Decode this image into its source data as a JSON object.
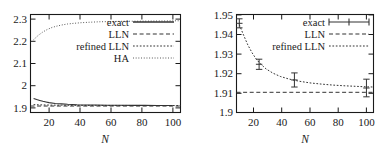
{
  "figure": {
    "panel_count": 2,
    "background_color": "#ffffff",
    "line_color": "#333333"
  },
  "chart_data": [
    {
      "id": "left",
      "type": "line",
      "title": "",
      "xlabel": "N",
      "ylabel": "",
      "xlim": [
        8,
        105
      ],
      "ylim": [
        1.88,
        2.335
      ],
      "xticks": [
        20,
        40,
        60,
        80,
        100
      ],
      "xticklabels": [
        "20",
        "40",
        "60",
        "80",
        "100"
      ],
      "yticks": [
        1.9,
        2.0,
        2.1,
        2.2,
        2.3
      ],
      "yticklabels": [
        "1.9",
        "2",
        "2.1",
        "2.2",
        "2.3"
      ],
      "grid": false,
      "legend_position": "upper right inside",
      "series": [
        {
          "name": "exact",
          "style": "solid",
          "x": [
            10,
            12,
            14,
            16,
            18,
            20,
            24,
            28,
            32,
            38,
            44,
            50,
            58,
            66,
            74,
            82,
            90,
            100
          ],
          "y": [
            1.945,
            1.94,
            1.936,
            1.932,
            1.929,
            1.926,
            1.922,
            1.92,
            1.918,
            1.916,
            1.915,
            1.9145,
            1.914,
            1.9135,
            1.913,
            1.913,
            1.9128,
            1.9125
          ]
        },
        {
          "name": "LLN",
          "style": "dashed",
          "x": [
            8,
            105
          ],
          "y": [
            1.91,
            1.91
          ]
        },
        {
          "name": "refined LLN",
          "style": "dotted",
          "x": [
            10,
            14,
            18,
            22,
            28,
            34,
            42,
            50,
            60,
            70,
            80,
            90,
            100,
            105
          ],
          "y": [
            1.9165,
            1.9155,
            1.9148,
            1.9143,
            1.9138,
            1.9134,
            1.9131,
            1.9129,
            1.9127,
            1.9126,
            1.9125,
            1.9124,
            1.9123,
            1.9123
          ]
        },
        {
          "name": "HA",
          "style": "fine-dotted",
          "x": [
            10,
            13,
            16,
            19,
            22,
            25,
            28,
            32,
            36,
            41,
            46,
            52,
            58,
            64,
            70,
            78,
            86,
            94,
            100,
            105
          ],
          "y": [
            2.218,
            2.238,
            2.254,
            2.266,
            2.275,
            2.281,
            2.286,
            2.291,
            2.294,
            2.297,
            2.299,
            2.301,
            2.302,
            2.303,
            2.3035,
            2.304,
            2.3045,
            2.305,
            2.3055,
            2.306
          ]
        }
      ],
      "legend": [
        {
          "label": "exact",
          "style": "solid"
        },
        {
          "label": "LLN",
          "style": "dashed"
        },
        {
          "label": "refined LLN",
          "style": "dotted"
        },
        {
          "label": "HA",
          "style": "fine-dotted"
        }
      ]
    },
    {
      "id": "right",
      "type": "line",
      "title": "",
      "xlabel": "N",
      "ylabel": "",
      "xlim": [
        8,
        105
      ],
      "ylim": [
        1.9,
        1.95
      ],
      "xticks": [
        20,
        40,
        60,
        80,
        100
      ],
      "xticklabels": [
        "20",
        "40",
        "60",
        "80",
        "100"
      ],
      "yticks": [
        1.9,
        1.91,
        1.92,
        1.93,
        1.94,
        1.95
      ],
      "yticklabels": [
        "1.9",
        "1.91",
        "1.92",
        "1.93",
        "1.94",
        "1.95"
      ],
      "grid": false,
      "legend_position": "upper right inside",
      "series": [
        {
          "name": "exact",
          "style": "errorbar",
          "x": [
            10,
            24,
            49,
            100
          ],
          "y": [
            1.9455,
            1.9246,
            1.9166,
            1.9125
          ],
          "yerr": [
            0.0023,
            0.0026,
            0.0036,
            0.0045
          ]
        },
        {
          "name": "LLN",
          "style": "dashed",
          "x": [
            8,
            105
          ],
          "y": [
            1.9103,
            1.9103
          ]
        },
        {
          "name": "refined LLN",
          "style": "dotted",
          "x": [
            10,
            13,
            16,
            19,
            22,
            25,
            29,
            34,
            39,
            45,
            52,
            60,
            68,
            76,
            85,
            94,
            100,
            105
          ],
          "y": [
            1.9448,
            1.9395,
            1.9345,
            1.9305,
            1.9272,
            1.9248,
            1.9222,
            1.92,
            1.9184,
            1.9171,
            1.916,
            1.9151,
            1.9145,
            1.914,
            1.9136,
            1.9133,
            1.9131,
            1.913
          ]
        }
      ],
      "legend": [
        {
          "label": "exact",
          "style": "errorbar"
        },
        {
          "label": "LLN",
          "style": "dashed"
        },
        {
          "label": "refined LLN",
          "style": "dotted"
        }
      ]
    }
  ]
}
